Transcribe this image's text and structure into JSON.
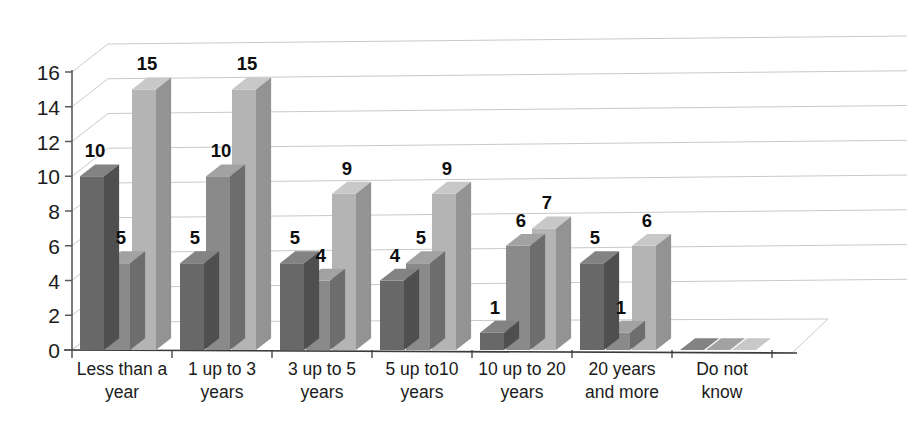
{
  "chart_data": {
    "type": "bar",
    "title": "",
    "subtitle": "",
    "xlabel": "",
    "ylabel": "",
    "ylim": [
      0,
      16
    ],
    "ytick_values": [
      0,
      2,
      4,
      6,
      8,
      10,
      12,
      14,
      16
    ],
    "ytick_labels": [
      "0",
      "2",
      "4",
      "6",
      "8",
      "10",
      "12",
      "14",
      "16"
    ],
    "grid": true,
    "legend": "none",
    "three_d": true,
    "categories": [
      "Less than a year",
      "1  up to 3 years",
      "3  up to 5 years",
      "5  up to10 years",
      "10 up to 20 years",
      "20 years and more",
      "Do not know"
    ],
    "category_lines": [
      [
        "Less than a",
        "year"
      ],
      [
        "1  up to 3",
        "years"
      ],
      [
        "3  up to 5",
        "years"
      ],
      [
        "5  up to10",
        "years"
      ],
      [
        "10 up to 20",
        "years"
      ],
      [
        "20 years",
        "and more"
      ],
      [
        "Do not",
        "know"
      ]
    ],
    "series": [
      {
        "name": "Series 1",
        "color": "#686868",
        "values": [
          10,
          5,
          5,
          4,
          1,
          5,
          0
        ]
      },
      {
        "name": "Series 2",
        "color": "#8a8a8a",
        "values": [
          5,
          10,
          4,
          5,
          6,
          1,
          0
        ]
      },
      {
        "name": "Series 3",
        "color": "#b4b4b4",
        "values": [
          15,
          15,
          9,
          9,
          7,
          6,
          0
        ]
      }
    ],
    "data_labels": [
      [
        "10",
        "5",
        "15"
      ],
      [
        "5",
        "10",
        "15"
      ],
      [
        "5",
        "4",
        "9"
      ],
      [
        "4",
        "5",
        "9"
      ],
      [
        "1",
        "6",
        "7"
      ],
      [
        "5",
        "1",
        "6"
      ],
      [
        "",
        "",
        ""
      ]
    ]
  },
  "colors": {
    "series1": "#686868",
    "series2": "#8a8a8a",
    "series3": "#b4b4b4",
    "series1_top": "#838383",
    "series2_top": "#a2a2a2",
    "series3_top": "#c8c8c8",
    "series1_side": "#4f4f4f",
    "series2_side": "#6d6d6d",
    "series3_side": "#939393",
    "gridline": "#c9c9c9",
    "axis": "#5a5a5a",
    "floor": "#ffffff",
    "text": "#1b1b1b",
    "background": "#ffffff"
  }
}
